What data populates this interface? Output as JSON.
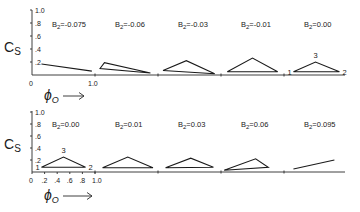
{
  "chart_data": {
    "type": "diagram",
    "title": "",
    "ylabel": "C_S",
    "xlabel": "φ_O",
    "xlim": [
      0,
      1.0
    ],
    "ylim": [
      0,
      1.0
    ],
    "rows": [
      {
        "y_ticks": [
          ".2",
          ".4",
          ".6",
          ".8",
          "1.0"
        ],
        "x_ticks": [
          "0",
          "1.0"
        ],
        "panels": [
          {
            "label": "B₂=-0.075",
            "shape": "line",
            "points": [
              [
                0.15,
                0.17
              ],
              [
                0.95,
                0.06
              ]
            ],
            "vertex_labels": []
          },
          {
            "label": "B₂=-0.06",
            "shape": "triangle",
            "points": [
              [
                0.08,
                0.1
              ],
              [
                0.15,
                0.19
              ],
              [
                0.88,
                0.03
              ]
            ],
            "vertex_labels": []
          },
          {
            "label": "B₂=-0.03",
            "shape": "triangle",
            "points": [
              [
                0.08,
                0.07
              ],
              [
                0.45,
                0.22
              ],
              [
                0.9,
                0.02
              ]
            ],
            "vertex_labels": []
          },
          {
            "label": "B₂=-0.01",
            "shape": "triangle",
            "points": [
              [
                0.1,
                0.05
              ],
              [
                0.5,
                0.26
              ],
              [
                0.9,
                0.05
              ]
            ],
            "vertex_labels": []
          },
          {
            "label": "B₂=0.00",
            "shape": "triangle",
            "points": [
              [
                0.15,
                0.05
              ],
              [
                0.5,
                0.2
              ],
              [
                0.88,
                0.05
              ]
            ],
            "vertex_labels": [
              "1",
              "3",
              "2"
            ]
          }
        ]
      },
      {
        "y_ticks": [
          ".2",
          ".4",
          ".6",
          ".8",
          "1.0"
        ],
        "x_ticks": [
          "0",
          ".2",
          ".4",
          ".6",
          ".8",
          "1.0"
        ],
        "panels": [
          {
            "label": "B₂=0.00",
            "shape": "triangle",
            "points": [
              [
                0.15,
                0.08
              ],
              [
                0.5,
                0.25
              ],
              [
                0.85,
                0.08
              ]
            ],
            "vertex_labels": [
              "1",
              "3",
              "2"
            ]
          },
          {
            "label": "B₂=0.01",
            "shape": "triangle",
            "points": [
              [
                0.12,
                0.07
              ],
              [
                0.52,
                0.25
              ],
              [
                0.92,
                0.07
              ]
            ],
            "vertex_labels": []
          },
          {
            "label": "B₂=0.03",
            "shape": "triangle",
            "points": [
              [
                0.12,
                0.07
              ],
              [
                0.52,
                0.23
              ],
              [
                0.88,
                0.08
              ]
            ],
            "vertex_labels": []
          },
          {
            "label": "B₂=0.06",
            "shape": "triangle",
            "points": [
              [
                0.05,
                0.03
              ],
              [
                0.55,
                0.22
              ],
              [
                0.75,
                0.08
              ]
            ],
            "vertex_labels": []
          },
          {
            "label": "B₂=0.095",
            "shape": "line",
            "points": [
              [
                0.15,
                0.05
              ],
              [
                0.8,
                0.2
              ]
            ],
            "vertex_labels": []
          }
        ]
      }
    ],
    "extra_y_label": "2"
  }
}
